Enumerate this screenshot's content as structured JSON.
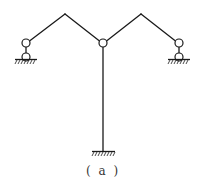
{
  "figure": {
    "caption": "( a )",
    "type": "structural frame diagram",
    "colors": {
      "line": "#1a1a1a",
      "background": "#ffffff",
      "caption": "#333333"
    },
    "nodes": {
      "left_support_hinge": {
        "x": 26,
        "y": 43
      },
      "left_apex": {
        "x": 65,
        "y": 14
      },
      "center_hinge": {
        "x": 103,
        "y": 43
      },
      "right_apex": {
        "x": 141,
        "y": 14
      },
      "right_support_hinge": {
        "x": 179,
        "y": 43
      },
      "bottom_fixed": {
        "x": 103,
        "y": 151
      }
    },
    "supports": [
      {
        "name": "left-roller-support",
        "kind": "link/roller (double hinge)"
      },
      {
        "name": "right-roller-support",
        "kind": "link/roller (double hinge)"
      },
      {
        "name": "bottom-fixed-support",
        "kind": "fixed"
      }
    ]
  }
}
